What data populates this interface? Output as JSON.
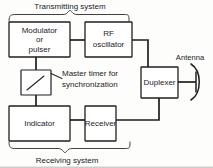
{
  "diagram": {
    "group_labels": {
      "transmitting": "Transmitting  system",
      "receiving": "Receiving  system"
    },
    "blocks": [
      {
        "id": "modulator",
        "lines": [
          "Modulator",
          "or",
          "pulser"
        ]
      },
      {
        "id": "rf_oscillator",
        "lines": [
          "RF",
          "oscillator"
        ]
      },
      {
        "id": "duplexer",
        "lines": [
          "Duplexer"
        ]
      },
      {
        "id": "indicator",
        "lines": [
          "Indicator"
        ]
      },
      {
        "id": "receiver",
        "lines": [
          "Receiver"
        ]
      }
    ],
    "annotations": {
      "master_timer_line1": "Master  timer  for",
      "master_timer_line2": "synchronization",
      "antenna": "Antenna"
    },
    "colors": {
      "ink": "#211f1e",
      "paper": "#fdfdfc",
      "wire": "#211f1e",
      "brace": "#3a3633"
    }
  }
}
